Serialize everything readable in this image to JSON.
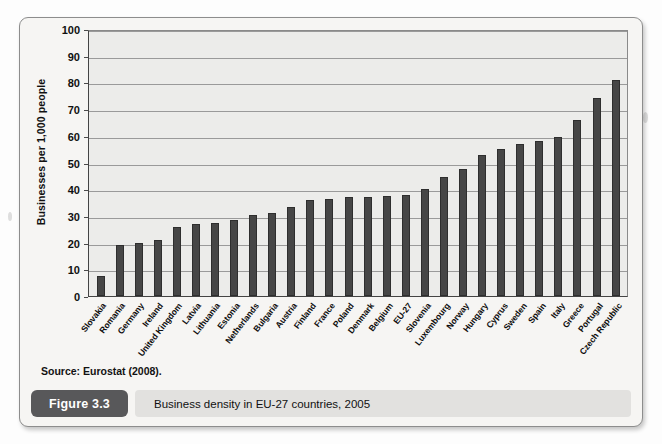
{
  "figure": {
    "tag": "Figure 3.3",
    "caption": "Business density in EU-27 countries, 2005",
    "source": "Source: Eurostat (2008)."
  },
  "chart_data": {
    "type": "bar",
    "title": "Business density in EU-27 countries, 2005",
    "xlabel": "",
    "ylabel": "Businesses per 1,000 people",
    "ylim": [
      0,
      100
    ],
    "ytick_values": [
      0,
      10,
      20,
      30,
      40,
      50,
      60,
      70,
      80,
      90,
      100
    ],
    "grid": true,
    "legend": null,
    "bar_color": "#464646",
    "plot_background": "#ececea",
    "categories": [
      "Slovakia",
      "Romania",
      "Germany",
      "Ireland",
      "United Kingdom",
      "Latvia",
      "Lithuania",
      "Estonia",
      "Netherlands",
      "Bulgaria",
      "Austria",
      "Finland",
      "France",
      "Poland",
      "Denmark",
      "Belgium",
      "EU-27",
      "Slovenia",
      "Luxembourg",
      "Norway",
      "Hungary",
      "Cyprus",
      "Sweden",
      "Spain",
      "Italy",
      "Greece",
      "Portugal",
      "Czech Republic"
    ],
    "values": [
      7.5,
      19,
      20,
      20.8,
      26,
      27,
      27.5,
      28.5,
      30.3,
      31,
      33.2,
      36,
      36.5,
      37,
      37.2,
      37.3,
      38,
      40,
      44.5,
      47.5,
      53,
      55,
      57,
      58,
      59.5,
      66,
      74,
      81
    ]
  }
}
